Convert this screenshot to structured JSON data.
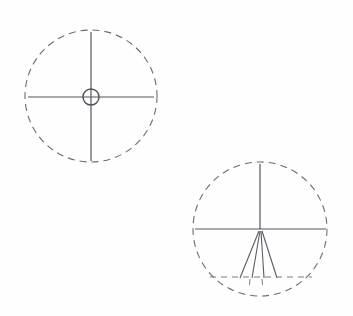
{
  "figure": {
    "canvas": {
      "width": 353,
      "height": 316,
      "background": "#fefefe"
    },
    "colors": {
      "line": "#55555d",
      "dashed_line": "#6b6b73",
      "hub": "#4f4f57",
      "background": "#fefefe"
    },
    "shapes": [
      {
        "id": "diagram-upper-left",
        "label": "Crosshair circle with central hub",
        "outer_circle": {
          "cx": 91,
          "cy": 96,
          "r": 66,
          "style": "dashed"
        },
        "hub_circle": {
          "cx": 91,
          "cy": 97,
          "r": 8,
          "style": "solid"
        },
        "lines": [
          {
            "name": "vertical-axis",
            "x1": 91,
            "y1": 32,
            "x2": 91,
            "y2": 161,
            "style": "solid"
          },
          {
            "name": "horizontal-axis",
            "x1": 28,
            "y1": 97,
            "x2": 154,
            "y2": 97,
            "style": "solid"
          }
        ]
      },
      {
        "id": "diagram-lower-right",
        "label": "Circle with radial fan and chord",
        "outer_circle": {
          "cx": 260,
          "cy": 229,
          "r": 67,
          "style": "dashed"
        },
        "lines": [
          {
            "name": "vertical-axis-upper",
            "x1": 260,
            "y1": 164,
            "x2": 260,
            "y2": 229,
            "style": "solid"
          },
          {
            "name": "horizontal-axis",
            "x1": 195,
            "y1": 229,
            "x2": 326,
            "y2": 229,
            "style": "solid"
          },
          {
            "name": "fan-ray-1",
            "x1": 259,
            "y1": 231,
            "x2": 240,
            "y2": 278,
            "style": "solid"
          },
          {
            "name": "fan-ray-2",
            "x1": 260,
            "y1": 231,
            "x2": 252,
            "y2": 278,
            "style": "solid"
          },
          {
            "name": "fan-ray-3",
            "x1": 261,
            "y1": 231,
            "x2": 264,
            "y2": 278,
            "style": "solid"
          },
          {
            "name": "fan-ray-4",
            "x1": 262,
            "y1": 231,
            "x2": 277,
            "y2": 278,
            "style": "solid"
          },
          {
            "name": "tick-below-chord-1",
            "x1": 250,
            "y1": 279,
            "x2": 249,
            "y2": 289,
            "style": "dashed"
          },
          {
            "name": "tick-below-chord-2",
            "x1": 262,
            "y1": 279,
            "x2": 263,
            "y2": 289,
            "style": "dashed"
          }
        ],
        "chord": {
          "name": "lower-chord",
          "x1": 210,
          "y1": 277,
          "x2": 312,
          "y2": 277,
          "style": "dashed"
        }
      }
    ]
  }
}
